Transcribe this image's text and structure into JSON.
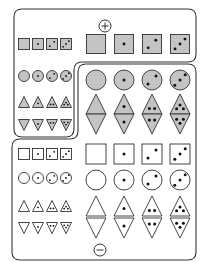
{
  "figure": {
    "title": "",
    "regions": [
      {
        "id": "positive",
        "label": "+",
        "description": "Filled (gray) shapes region: top band and left column"
      },
      {
        "id": "negative",
        "label": "−",
        "description": "Outline (white) shapes region: right column and bottom band"
      }
    ],
    "colors": {
      "fill_gray": "#c4c4c4",
      "stroke": "#333333",
      "background": "#ffffff",
      "dot": "#111111"
    },
    "shape_types": [
      "square",
      "circle",
      "triangle-up",
      "triangle-down"
    ],
    "dot_counts": [
      0,
      1,
      2,
      3
    ],
    "size_groups": [
      "small",
      "large"
    ],
    "fill_groups": [
      "gray",
      "white"
    ],
    "plus_symbol": "⊕",
    "minus_symbol": "⊖"
  }
}
